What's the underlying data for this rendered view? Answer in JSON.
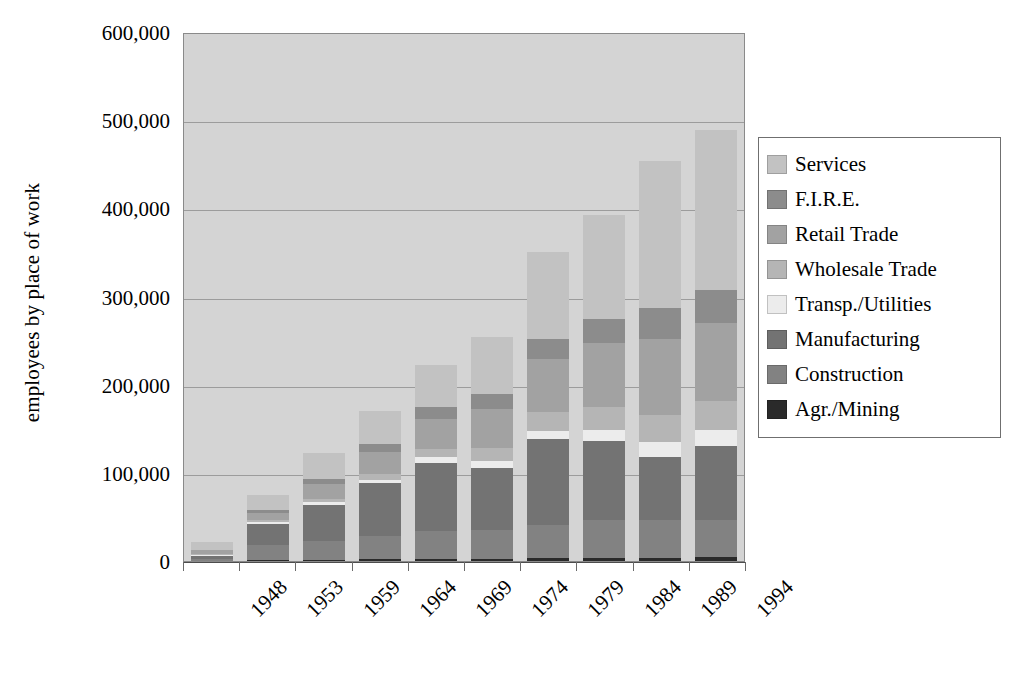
{
  "chart_data": {
    "type": "bar",
    "subtype": "stacked-bar",
    "title": "",
    "xlabel": "",
    "ylabel": "employees by place of work",
    "ylim": [
      0,
      600000
    ],
    "ytick_step": 100000,
    "ytick_labels": [
      "600,000",
      "500,000",
      "400,000",
      "300,000",
      "200,000",
      "100,000",
      "0"
    ],
    "ytick_values": [
      600000,
      500000,
      400000,
      300000,
      200000,
      100000,
      0
    ],
    "categories": [
      "1948",
      "1953",
      "1959",
      "1964",
      "1969",
      "1974",
      "1979",
      "1984",
      "1989",
      "1994"
    ],
    "grid": true,
    "grid_axis": "y",
    "legend_position": "right",
    "stack_order_bottom_to_top": [
      "Agr./Mining",
      "Construction",
      "Manufacturing",
      "Transp./Utilities",
      "Wholesale Trade",
      "Retail Trade",
      "F.I.R.E.",
      "Services"
    ],
    "series": [
      {
        "name": "Services",
        "color": "#c2c2c2",
        "values": [
          9000,
          17000,
          29000,
          37000,
          48000,
          65000,
          98000,
          118000,
          166000,
          182000
        ]
      },
      {
        "name": "F.I.R.E.",
        "color": "#8c8c8c",
        "values": [
          1000,
          3000,
          6000,
          9000,
          13000,
          17000,
          23000,
          28000,
          36000,
          37000
        ]
      },
      {
        "name": "Retail Trade",
        "color": "#a2a2a2",
        "values": [
          4000,
          9000,
          17000,
          25000,
          34000,
          44000,
          60000,
          72000,
          86000,
          88000
        ]
      },
      {
        "name": "Wholesale Trade",
        "color": "#b5b5b5",
        "values": [
          1000,
          2000,
          4000,
          7000,
          10000,
          15000,
          21000,
          26000,
          31000,
          33000
        ]
      },
      {
        "name": "Transp./Utilities",
        "color": "#ececec",
        "values": [
          1000,
          2000,
          3000,
          4000,
          6000,
          8000,
          10000,
          13000,
          16000,
          18000
        ]
      },
      {
        "name": "Manufacturing",
        "color": "#737373",
        "values": [
          4000,
          24000,
          41000,
          60000,
          78000,
          70000,
          97000,
          90000,
          72000,
          85000
        ]
      },
      {
        "name": "Construction",
        "color": "#828282",
        "values": [
          1500,
          17000,
          21000,
          26000,
          31000,
          33000,
          38000,
          43000,
          43000,
          42000
        ]
      },
      {
        "name": "Agr./Mining",
        "color": "#2a2a2a",
        "values": [
          500,
          1000,
          1500,
          2000,
          2500,
          2500,
          3000,
          3000,
          3500,
          4000
        ]
      }
    ],
    "totals": [
      22000,
      75000,
      122500,
      170000,
      222500,
      254500,
      350000,
      393000,
      453500,
      489000
    ]
  },
  "legend": {
    "items": [
      {
        "label": "Services",
        "color": "#c2c2c2"
      },
      {
        "label": "F.I.R.E.",
        "color": "#8c8c8c"
      },
      {
        "label": "Retail Trade",
        "color": "#a2a2a2"
      },
      {
        "label": "Wholesale Trade",
        "color": "#b5b5b5"
      },
      {
        "label": "Transp./Utilities",
        "color": "#ececec"
      },
      {
        "label": "Manufacturing",
        "color": "#737373"
      },
      {
        "label": "Construction",
        "color": "#828282"
      },
      {
        "label": "Agr./Mining",
        "color": "#2a2a2a"
      }
    ]
  },
  "style": {
    "plot_background": "#d4d4d4",
    "gridline_color": "#9c9c9c",
    "axis_color": "#4c4c4c",
    "legend_border": "#6f6f6f",
    "page_background": "#ffffff"
  }
}
